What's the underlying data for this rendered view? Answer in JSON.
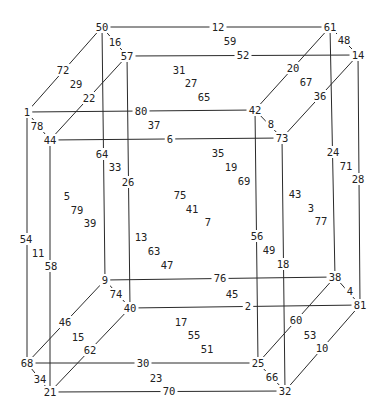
{
  "diagram": {
    "type": "tesseract-labeling",
    "vertices": [
      {
        "id": "50",
        "x": 102,
        "y": 27
      },
      {
        "id": "61",
        "x": 330,
        "y": 27
      },
      {
        "id": "57",
        "x": 127,
        "y": 56
      },
      {
        "id": "14",
        "x": 358,
        "y": 55
      },
      {
        "id": "1",
        "x": 27,
        "y": 112
      },
      {
        "id": "42",
        "x": 255,
        "y": 110
      },
      {
        "id": "44",
        "x": 50,
        "y": 140
      },
      {
        "id": "73",
        "x": 282,
        "y": 138
      },
      {
        "id": "9",
        "x": 105,
        "y": 280
      },
      {
        "id": "38",
        "x": 335,
        "y": 277
      },
      {
        "id": "40",
        "x": 130,
        "y": 308
      },
      {
        "id": "81",
        "x": 360,
        "y": 305
      },
      {
        "id": "68",
        "x": 27,
        "y": 363
      },
      {
        "id": "25",
        "x": 258,
        "y": 363
      },
      {
        "id": "21",
        "x": 50,
        "y": 392
      },
      {
        "id": "32",
        "x": 285,
        "y": 391
      }
    ],
    "edges": [
      {
        "label": "12",
        "from": "50",
        "to": "61",
        "lx": 218,
        "ly": 27
      },
      {
        "label": "52",
        "from": "57",
        "to": "14",
        "lx": 243,
        "ly": 55
      },
      {
        "label": "80",
        "from": "1",
        "to": "42",
        "lx": 141,
        "ly": 111
      },
      {
        "label": "6",
        "from": "44",
        "to": "73",
        "lx": 170,
        "ly": 139
      },
      {
        "label": "76",
        "from": "9",
        "to": "38",
        "lx": 220,
        "ly": 278
      },
      {
        "label": "2",
        "from": "40",
        "to": "81",
        "lx": 248,
        "ly": 306
      },
      {
        "label": "30",
        "from": "68",
        "to": "25",
        "lx": 143,
        "ly": 363
      },
      {
        "label": "70",
        "from": "21",
        "to": "32",
        "lx": 169,
        "ly": 391
      },
      {
        "label": "16",
        "from": "50",
        "to": "57",
        "lx": 115,
        "ly": 42
      },
      {
        "label": "48",
        "from": "61",
        "to": "14",
        "lx": 344,
        "ly": 40
      },
      {
        "label": "78",
        "from": "1",
        "to": "44",
        "lx": 37,
        "ly": 126
      },
      {
        "label": "8",
        "from": "42",
        "to": "73",
        "lx": 271,
        "ly": 124
      },
      {
        "label": "74",
        "from": "9",
        "to": "40",
        "lx": 116,
        "ly": 294
      },
      {
        "label": "4",
        "from": "38",
        "to": "81",
        "lx": 350,
        "ly": 291
      },
      {
        "label": "34",
        "from": "68",
        "to": "21",
        "lx": 40,
        "ly": 379
      },
      {
        "label": "66",
        "from": "25",
        "to": "32",
        "lx": 272,
        "ly": 377
      },
      {
        "label": "72",
        "from": "50",
        "to": "1",
        "lx": 63,
        "ly": 70
      },
      {
        "label": "22",
        "from": "57",
        "to": "44",
        "lx": 89,
        "ly": 98
      },
      {
        "label": "20",
        "from": "61",
        "to": "42",
        "lx": 293,
        "ly": 68
      },
      {
        "label": "36",
        "from": "14",
        "to": "73",
        "lx": 320,
        "ly": 96
      },
      {
        "label": "46",
        "from": "9",
        "to": "68",
        "lx": 65,
        "ly": 322
      },
      {
        "label": "62",
        "from": "40",
        "to": "21",
        "lx": 90,
        "ly": 350
      },
      {
        "label": "60",
        "from": "38",
        "to": "25",
        "lx": 296,
        "ly": 320
      },
      {
        "label": "10",
        "from": "81",
        "to": "32",
        "lx": 322,
        "ly": 348
      },
      {
        "label": "54",
        "from": "1",
        "to": "68",
        "lx": 26,
        "ly": 239
      },
      {
        "label": "58",
        "from": "44",
        "to": "21",
        "lx": 51,
        "ly": 266
      },
      {
        "label": "64",
        "from": "50",
        "to": "9",
        "lx": 102,
        "ly": 154
      },
      {
        "label": "26",
        "from": "57",
        "to": "40",
        "lx": 128,
        "ly": 182
      },
      {
        "label": "56",
        "from": "42",
        "to": "25",
        "lx": 257,
        "ly": 236
      },
      {
        "label": "18",
        "from": "73",
        "to": "32",
        "lx": 283,
        "ly": 264
      },
      {
        "label": "24",
        "from": "61",
        "to": "38",
        "lx": 333,
        "ly": 152
      },
      {
        "label": "28",
        "from": "14",
        "to": "81",
        "lx": 358,
        "ly": 179
      }
    ],
    "face_labels": [
      {
        "label": "59",
        "x": 230,
        "y": 41
      },
      {
        "label": "31",
        "x": 179,
        "y": 70
      },
      {
        "label": "27",
        "x": 191,
        "y": 83
      },
      {
        "label": "65",
        "x": 204,
        "y": 97
      },
      {
        "label": "29",
        "x": 76,
        "y": 84
      },
      {
        "label": "67",
        "x": 306,
        "y": 82
      },
      {
        "label": "37",
        "x": 154,
        "y": 125
      },
      {
        "label": "35",
        "x": 218,
        "y": 153
      },
      {
        "label": "19",
        "x": 231,
        "y": 167
      },
      {
        "label": "69",
        "x": 244,
        "y": 181
      },
      {
        "label": "33",
        "x": 115,
        "y": 167
      },
      {
        "label": "71",
        "x": 346,
        "y": 166
      },
      {
        "label": "5",
        "x": 67,
        "y": 196
      },
      {
        "label": "79",
        "x": 77,
        "y": 210
      },
      {
        "label": "39",
        "x": 90,
        "y": 223
      },
      {
        "label": "75",
        "x": 180,
        "y": 195
      },
      {
        "label": "41",
        "x": 192,
        "y": 209
      },
      {
        "label": "7",
        "x": 208,
        "y": 222
      },
      {
        "label": "43",
        "x": 295,
        "y": 194
      },
      {
        "label": "3",
        "x": 311,
        "y": 208
      },
      {
        "label": "77",
        "x": 321,
        "y": 221
      },
      {
        "label": "11",
        "x": 38,
        "y": 253
      },
      {
        "label": "13",
        "x": 141,
        "y": 237
      },
      {
        "label": "63",
        "x": 154,
        "y": 251
      },
      {
        "label": "47",
        "x": 167,
        "y": 265
      },
      {
        "label": "49",
        "x": 269,
        "y": 250
      },
      {
        "label": "45",
        "x": 232,
        "y": 294
      },
      {
        "label": "17",
        "x": 181,
        "y": 322
      },
      {
        "label": "55",
        "x": 194,
        "y": 335
      },
      {
        "label": "51",
        "x": 207,
        "y": 349
      },
      {
        "label": "15",
        "x": 78,
        "y": 337
      },
      {
        "label": "53",
        "x": 310,
        "y": 335
      },
      {
        "label": "23",
        "x": 156,
        "y": 378
      }
    ]
  }
}
